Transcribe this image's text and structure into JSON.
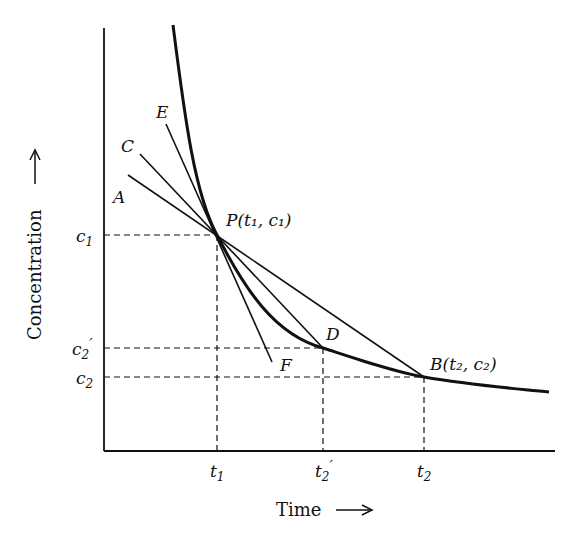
{
  "diagram": {
    "x_axis_label": "Time",
    "y_axis_label": "Concentration",
    "x_ticks": [
      {
        "base": "t",
        "sub": "1",
        "prime": ""
      },
      {
        "base": "t",
        "sub": "2",
        "prime": "′"
      },
      {
        "base": "t",
        "sub": "2",
        "prime": ""
      }
    ],
    "y_ticks": [
      {
        "base": "c",
        "sub": "1",
        "prime": ""
      },
      {
        "base": "c",
        "sub": "2",
        "prime": "′"
      },
      {
        "base": "c",
        "sub": "2",
        "prime": ""
      }
    ],
    "points": {
      "P": "P(t₁, c₁)",
      "B": "B(t₂, c₂)",
      "D": "D"
    },
    "line_labels": {
      "A": "A",
      "C": "C",
      "E": "E",
      "F": "F"
    },
    "colors": {
      "ink": "#111111",
      "background": "#ffffff"
    }
  }
}
